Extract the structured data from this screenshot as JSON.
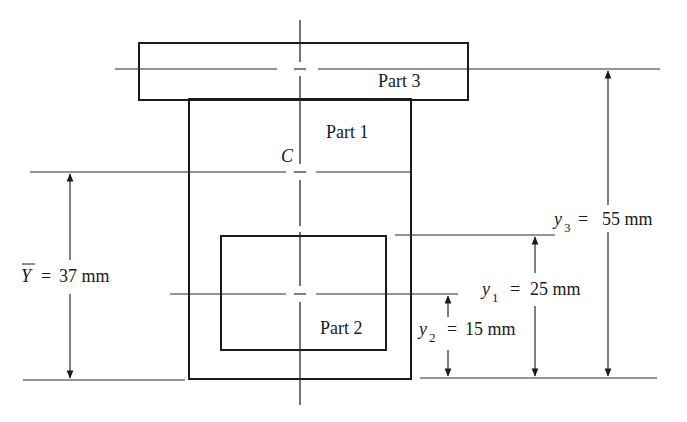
{
  "figure": {
    "type": "composite-area-centroid-diagram",
    "units": "mm"
  },
  "parts": [
    {
      "id": "part3",
      "label": "Part 3",
      "shape": "rectangle",
      "filled": true,
      "description": "top flange"
    },
    {
      "id": "part1",
      "label": "Part 1",
      "shape": "rectangle",
      "filled": true,
      "description": "main web block"
    },
    {
      "id": "part2",
      "label": "Part 2",
      "shape": "rectangle",
      "filled": false,
      "description": "rectangular cutout (hole)"
    }
  ],
  "centroid": {
    "label": "C"
  },
  "dimensions": {
    "Ybar": {
      "symbol": "Y",
      "overbar": true,
      "equals": "=",
      "value": "37 mm",
      "text": "Y̅ = 37 mm"
    },
    "y1": {
      "symbol": "y",
      "subscript": "1",
      "equals": "=",
      "value": "25 mm"
    },
    "y2": {
      "symbol": "y",
      "subscript": "2",
      "equals": "=",
      "value": "15 mm"
    },
    "y3": {
      "symbol": "y",
      "subscript": "3",
      "equals": "=",
      "value": "55 mm"
    }
  },
  "colors": {
    "ink": "#1a1a1a",
    "stipple_dot": "#6b6b6b",
    "background": "#ffffff"
  }
}
